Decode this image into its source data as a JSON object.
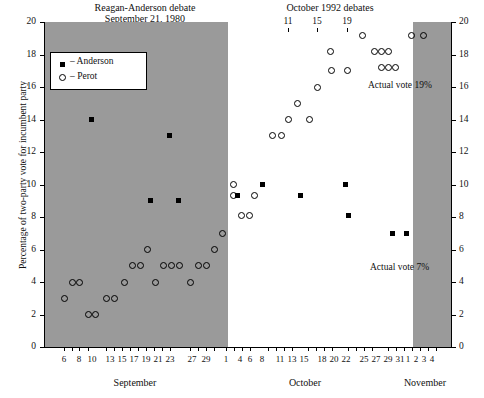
{
  "chart_data": {
    "type": "scatter",
    "title": "",
    "titles": {
      "left": "Reagan-Anderson  debate\nSeptember 21, 1980",
      "right": "October 1992 debates"
    },
    "ylabel": "Percentage of two-party vote for incumbent party",
    "xlabel": "",
    "ylim": [
      0,
      20
    ],
    "yticks": [
      0,
      2,
      4,
      6,
      8,
      10,
      12,
      14,
      16,
      18,
      20
    ],
    "grid": false,
    "legend": {
      "position": "top-left",
      "entries": [
        {
          "name": "Anderson",
          "marker": "filled-square",
          "dash": "–"
        },
        {
          "name": "Perot",
          "marker": "open-circle",
          "dash": "–"
        }
      ]
    },
    "months": [
      "September",
      "October",
      "November"
    ],
    "xticklabels_september": [
      "6",
      "8",
      "10",
      "13",
      "15",
      "17",
      "19",
      "21",
      "23",
      "27",
      "29"
    ],
    "xticklabels_october": [
      "1",
      "4",
      "6",
      "8",
      "11",
      "13",
      "15",
      "18",
      "20",
      "22",
      "25",
      "27",
      "29",
      "31"
    ],
    "xticklabels_november": [
      "1",
      "2",
      "3",
      "4"
    ],
    "debate_marks": {
      "label_group": "October 1992 debates",
      "days": [
        "11",
        "15",
        "19"
      ]
    },
    "shaded_bands": [
      {
        "note": "1980 campaign period (shaded)"
      },
      {
        "note": "post-election 1992 period (shaded)"
      }
    ],
    "annotations": [
      {
        "text": "Actual vote 19%",
        "value": 19,
        "series": "Perot"
      },
      {
        "text": "Actual vote 7%",
        "value": 7,
        "series": "Anderson"
      }
    ],
    "series": [
      {
        "name": "Anderson",
        "marker": "filled-square",
        "points": [
          {
            "x": 91,
            "y": 14.0
          },
          {
            "x": 150,
            "y": 9.0
          },
          {
            "x": 169,
            "y": 13.0
          },
          {
            "x": 178,
            "y": 9.0
          },
          {
            "x": 237,
            "y": 9.3
          },
          {
            "x": 262,
            "y": 10.0
          },
          {
            "x": 300,
            "y": 9.3
          },
          {
            "x": 345,
            "y": 10.0
          },
          {
            "x": 348,
            "y": 8.1
          },
          {
            "x": 392,
            "y": 7.0
          },
          {
            "x": 406,
            "y": 7.0
          }
        ]
      },
      {
        "name": "Perot",
        "marker": "open-circle",
        "points": [
          {
            "x": 64,
            "y": 3.0
          },
          {
            "x": 72,
            "y": 4.0
          },
          {
            "x": 79,
            "y": 4.0
          },
          {
            "x": 88,
            "y": 2.0
          },
          {
            "x": 95,
            "y": 2.0
          },
          {
            "x": 106,
            "y": 3.0
          },
          {
            "x": 114,
            "y": 3.0
          },
          {
            "x": 124,
            "y": 4.0
          },
          {
            "x": 132,
            "y": 5.0
          },
          {
            "x": 140,
            "y": 5.0
          },
          {
            "x": 147,
            "y": 6.0
          },
          {
            "x": 155,
            "y": 4.0
          },
          {
            "x": 163,
            "y": 5.0
          },
          {
            "x": 171,
            "y": 5.0
          },
          {
            "x": 179,
            "y": 5.0
          },
          {
            "x": 190,
            "y": 4.0
          },
          {
            "x": 198,
            "y": 5.0
          },
          {
            "x": 206,
            "y": 5.0
          },
          {
            "x": 214,
            "y": 6.0
          },
          {
            "x": 222,
            "y": 7.0
          },
          {
            "x": 233,
            "y": 10.0
          },
          {
            "x": 233,
            "y": 9.3
          },
          {
            "x": 241,
            "y": 8.1
          },
          {
            "x": 249,
            "y": 8.1
          },
          {
            "x": 254,
            "y": 9.3
          },
          {
            "x": 272,
            "y": 13.0
          },
          {
            "x": 281,
            "y": 13.0
          },
          {
            "x": 288,
            "y": 14.0
          },
          {
            "x": 297,
            "y": 15.0
          },
          {
            "x": 309,
            "y": 14.0
          },
          {
            "x": 317,
            "y": 16.0
          },
          {
            "x": 331,
            "y": 17.0
          },
          {
            "x": 347,
            "y": 17.0
          },
          {
            "x": 330,
            "y": 18.2
          },
          {
            "x": 362,
            "y": 19.2
          },
          {
            "x": 374,
            "y": 18.2
          },
          {
            "x": 381,
            "y": 18.2
          },
          {
            "x": 388,
            "y": 18.2
          },
          {
            "x": 381,
            "y": 17.2
          },
          {
            "x": 388,
            "y": 17.2
          },
          {
            "x": 395,
            "y": 17.2
          },
          {
            "x": 411,
            "y": 19.2
          },
          {
            "x": 423,
            "y": 19.2
          }
        ]
      }
    ]
  },
  "axes": {
    "y_left_labels": [
      "0",
      "2",
      "4",
      "6",
      "8",
      "10",
      "12",
      "14",
      "16",
      "18",
      "20"
    ],
    "y_right_labels": [
      "0",
      "2",
      "4",
      "6",
      "8",
      "10",
      "12",
      "14",
      "16",
      "18",
      "20"
    ]
  }
}
